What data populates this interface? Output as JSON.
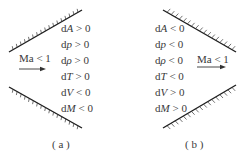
{
  "panels": [
    {
      "id": "a",
      "caption": "( a )",
      "flow_label": "Ma < 1",
      "flow_direction": "left-to-right",
      "duct_shape": "diverging",
      "relations": [
        {
          "var": "A",
          "op": ">",
          "val": "0"
        },
        {
          "var": "p",
          "op": ">",
          "val": "0"
        },
        {
          "var": "ρ",
          "op": ">",
          "val": "0"
        },
        {
          "var": "T",
          "op": ">",
          "val": "0"
        },
        {
          "var": "V",
          "op": "<",
          "val": "0"
        },
        {
          "var": "M",
          "op": "<",
          "val": "0"
        }
      ]
    },
    {
      "id": "b",
      "caption": "( b )",
      "flow_label": "Ma < 1",
      "flow_direction": "left-to-right",
      "duct_shape": "converging",
      "relations": [
        {
          "var": "A",
          "op": "<",
          "val": "0"
        },
        {
          "var": "p",
          "op": "<",
          "val": "0"
        },
        {
          "var": "ρ",
          "op": "<",
          "val": "0"
        },
        {
          "var": "T",
          "op": "<",
          "val": "0"
        },
        {
          "var": "V",
          "op": ">",
          "val": "0"
        },
        {
          "var": "M",
          "op": ">",
          "val": "0"
        }
      ]
    }
  ],
  "colors": {
    "wall": "#1e1e1e",
    "text": "#3a3a3a",
    "background": "#ffffff"
  }
}
